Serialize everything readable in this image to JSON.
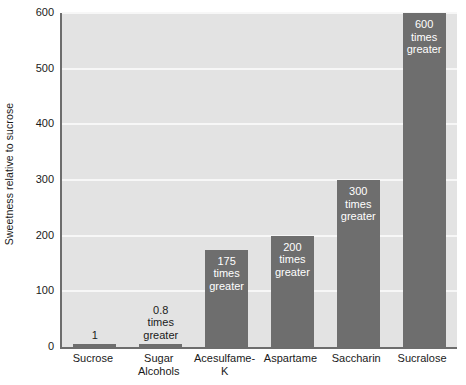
{
  "chart_data": {
    "type": "bar",
    "title": "",
    "xlabel": "",
    "ylabel": "Sweetness relative to sucrose",
    "ylim": [
      0,
      600
    ],
    "ytick_labels": [
      "600",
      "500",
      "400",
      "300",
      "200",
      "100",
      "0"
    ],
    "ytick_values": [
      600,
      500,
      400,
      300,
      200,
      100,
      0
    ],
    "grid": true,
    "legend": "none",
    "categories": [
      "Sucrose",
      "Sugar\nAlcohols",
      "Acesulfame-K",
      "Aspartame",
      "Saccharin",
      "Sucralose"
    ],
    "values": [
      1,
      0.8,
      175,
      200,
      300,
      600
    ],
    "data_labels": [
      "1",
      "0.8\ntimes\ngreater",
      "175\ntimes\ngreater",
      "200\ntimes\ngreater",
      "300\ntimes\ngreater",
      "600\ntimes\ngreater"
    ],
    "label_placement": [
      "outside",
      "outside",
      "inside",
      "inside",
      "inside",
      "inside"
    ],
    "colors": {
      "bar": "#6e6e6e",
      "plot_background": "#e3e3e3",
      "gridline": "#f7f7f7",
      "axis": "#6d6d6d",
      "text": "#1a1a1a",
      "inside_label_text": "#ffffff",
      "page_background": "#ffffff"
    }
  }
}
